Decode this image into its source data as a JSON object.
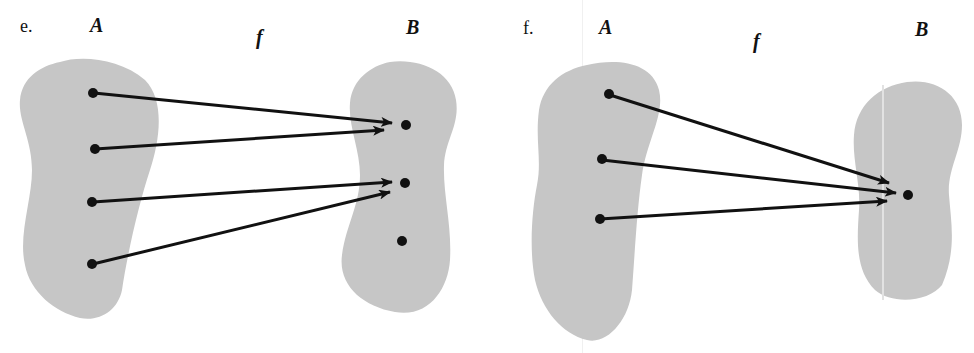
{
  "figures": [
    {
      "id": "e",
      "label": "e.",
      "domain_set": "A",
      "codomain_set": "B",
      "function_name": "f",
      "domain_points": 4,
      "codomain_points": 3,
      "mapping": [
        [
          1,
          1
        ],
        [
          2,
          1
        ],
        [
          3,
          2
        ],
        [
          4,
          2
        ]
      ],
      "note": "codomain point 3 has no preimage"
    },
    {
      "id": "f",
      "label": "f.",
      "domain_set": "A",
      "codomain_set": "B",
      "function_name": "f",
      "domain_points": 3,
      "codomain_points": 1,
      "mapping": [
        [
          1,
          1
        ],
        [
          2,
          1
        ],
        [
          3,
          1
        ]
      ],
      "note": "all domain points map to the single codomain point"
    }
  ],
  "colors": {
    "set_fill": "#c6c6c6",
    "ink": "#111111",
    "background": "#ffffff"
  }
}
